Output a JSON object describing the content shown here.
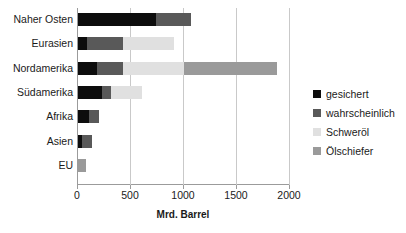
{
  "chart_data": {
    "type": "bar",
    "orientation": "horizontal",
    "stacked": true,
    "title": "",
    "xlabel": "Mrd. Barrel",
    "ylabel": "",
    "xlim": [
      0,
      2000
    ],
    "xticks": [
      0,
      500,
      1000,
      1500,
      2000
    ],
    "ticklabels": [
      "0",
      "500",
      "1000",
      "1500",
      "2000"
    ],
    "grid": "vertical",
    "legend_position": "right",
    "categories": [
      "Naher Osten",
      "Eurasien",
      "Nordamerika",
      "Südamerika",
      "Afrika",
      "Asien",
      "EU"
    ],
    "series": [
      {
        "name": "gesichert",
        "color": "#0D0D0D",
        "values": [
          735,
          85,
          180,
          225,
          105,
          40,
          0
        ]
      },
      {
        "name": "wahrscheinlich",
        "color": "#595959",
        "values": [
          330,
          340,
          245,
          85,
          95,
          95,
          0
        ]
      },
      {
        "name": "Schweröl",
        "color": "#E0E0E0",
        "values": [
          0,
          480,
          575,
          290,
          0,
          0,
          0
        ]
      },
      {
        "name": "Ölschiefer",
        "color": "#9A9A9A",
        "values": [
          0,
          0,
          880,
          0,
          0,
          0,
          80
        ]
      }
    ]
  },
  "legend": {
    "items": [
      {
        "label": "gesichert"
      },
      {
        "label": "wahrscheinlich"
      },
      {
        "label": "Schweröl"
      },
      {
        "label": "Ölschiefer"
      }
    ]
  }
}
